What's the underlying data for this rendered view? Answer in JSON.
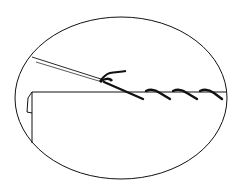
{
  "diagram": {
    "background": "#ffffff",
    "stroke_color": "#111111",
    "elements": [
      {
        "name": "magnifier-oval",
        "type": "ellipse"
      },
      {
        "name": "fabric-edge",
        "type": "folded fabric"
      },
      {
        "name": "needle",
        "type": "needle"
      },
      {
        "name": "thread",
        "type": "thread"
      },
      {
        "name": "stitches",
        "type": "diagonal stitches",
        "count": 4
      }
    ]
  }
}
